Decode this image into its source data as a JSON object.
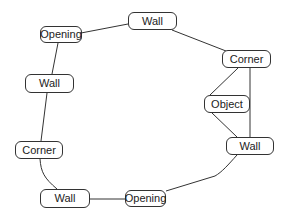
{
  "diagram": {
    "type": "graph",
    "nodes": [
      {
        "id": "opening_top",
        "label": "Opening",
        "x": 40,
        "y": 26,
        "w": 42,
        "h": 17
      },
      {
        "id": "wall_top",
        "label": "Wall",
        "x": 128,
        "y": 12,
        "w": 49,
        "h": 18
      },
      {
        "id": "corner_right",
        "label": "Corner",
        "x": 222,
        "y": 50,
        "w": 49,
        "h": 18
      },
      {
        "id": "object",
        "label": "Object",
        "x": 204,
        "y": 95,
        "w": 46,
        "h": 18
      },
      {
        "id": "wall_right",
        "label": "Wall",
        "x": 226,
        "y": 137,
        "w": 48,
        "h": 18
      },
      {
        "id": "opening_bottom",
        "label": "Opening",
        "x": 125,
        "y": 190,
        "w": 41,
        "h": 17
      },
      {
        "id": "wall_bottom",
        "label": "Wall",
        "x": 40,
        "y": 189,
        "w": 50,
        "h": 19
      },
      {
        "id": "corner_left",
        "label": "Corner",
        "x": 15,
        "y": 141,
        "w": 48,
        "h": 18
      },
      {
        "id": "wall_left",
        "label": "Wall",
        "x": 25,
        "y": 74,
        "w": 49,
        "h": 19
      }
    ],
    "edges": [
      {
        "from": "opening_top",
        "to": "wall_top",
        "d": "M81,33 L128,24"
      },
      {
        "from": "wall_top",
        "to": "corner_right",
        "d": "M172,30 L226,51"
      },
      {
        "from": "corner_right",
        "to": "object",
        "d": "M238,68 L210,95"
      },
      {
        "from": "corner_right",
        "to": "wall_right",
        "d": "M250,68 L250,137"
      },
      {
        "from": "object",
        "to": "wall_right",
        "d": "M212,113 L237,137"
      },
      {
        "from": "wall_right",
        "to": "opening_bottom",
        "d": "M237,155 C228,165 222,172 215,176 L166,191"
      },
      {
        "from": "wall_bottom",
        "to": "opening_bottom",
        "d": "M90,199 L125,199"
      },
      {
        "from": "corner_left",
        "to": "wall_bottom",
        "d": "M40,159 C41,172 44,178 57,189"
      },
      {
        "from": "wall_left",
        "to": "corner_left",
        "d": "M47,93 L41,141"
      },
      {
        "from": "opening_top",
        "to": "wall_left",
        "d": "M58,43 L52,74"
      }
    ],
    "colors": {
      "stroke": "#333333",
      "text": "#222222",
      "background": "#ffffff"
    }
  }
}
